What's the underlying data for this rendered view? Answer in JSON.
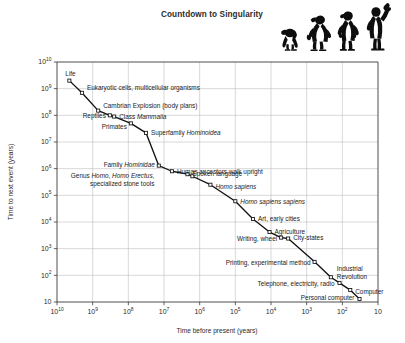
{
  "figure": {
    "title": "Countdown to Singularity",
    "width": 405,
    "height": 343,
    "background": "#ffffff",
    "ink_color": "#111111",
    "grid_color": "#b8b8b8"
  },
  "decoration": {
    "evolution_figures": {
      "name": "march-of-progress-silhouettes",
      "count": 4,
      "description": "ape to upright human holding torch",
      "color": "#0d0d0d"
    }
  },
  "chart_data": {
    "type": "line",
    "title": "Countdown to Singularity",
    "xlabel": "Time before present (years)",
    "ylabel": "Time to next event (years)",
    "xscale": "log",
    "yscale": "log",
    "x_reversed": true,
    "xlim": [
      10000000000,
      10
    ],
    "ylim": [
      10,
      10000000000
    ],
    "grid": true,
    "legend": "none",
    "marker": "open-square",
    "xticks": [
      {
        "value": 10000000000,
        "mantissa": "10",
        "exponent": "10"
      },
      {
        "value": 1000000000,
        "mantissa": "10",
        "exponent": "9"
      },
      {
        "value": 100000000,
        "mantissa": "10",
        "exponent": "8"
      },
      {
        "value": 10000000,
        "mantissa": "10",
        "exponent": "7"
      },
      {
        "value": 1000000,
        "mantissa": "10",
        "exponent": "6"
      },
      {
        "value": 100000,
        "mantissa": "10",
        "exponent": "5"
      },
      {
        "value": 10000,
        "mantissa": "10",
        "exponent": "4"
      },
      {
        "value": 1000,
        "mantissa": "10",
        "exponent": "3"
      },
      {
        "value": 100,
        "mantissa": "10",
        "exponent": "2"
      },
      {
        "value": 10,
        "mantissa": "10",
        "exponent": ""
      }
    ],
    "yticks": [
      {
        "value": 10000000000,
        "mantissa": "10",
        "exponent": "10"
      },
      {
        "value": 1000000000,
        "mantissa": "10",
        "exponent": "9"
      },
      {
        "value": 100000000,
        "mantissa": "10",
        "exponent": "8"
      },
      {
        "value": 10000000,
        "mantissa": "10",
        "exponent": "7"
      },
      {
        "value": 1000000,
        "mantissa": "10",
        "exponent": "6"
      },
      {
        "value": 100000,
        "mantissa": "10",
        "exponent": "5"
      },
      {
        "value": 10000,
        "mantissa": "10",
        "exponent": "4"
      },
      {
        "value": 1000,
        "mantissa": "10",
        "exponent": "3"
      },
      {
        "value": 100,
        "mantissa": "10",
        "exponent": "2"
      },
      {
        "value": 10,
        "mantissa": "10",
        "exponent": ""
      }
    ],
    "points": [
      {
        "label": "Life",
        "x": 4500000000,
        "y": 2000000000,
        "label_dx": -4,
        "label_dy": -5,
        "anchor": "start",
        "lines": [
          [
            {
              "t": "Life"
            }
          ]
        ]
      },
      {
        "label": "Eukaryotic cells, multicellular organisms",
        "x": 2000000000,
        "y": 700000000,
        "label_dx": 5,
        "label_dy": -2.5,
        "anchor": "start",
        "lines": [
          [
            {
              "t": "Eukaryotic cells, multicellular organisms"
            }
          ]
        ]
      },
      {
        "label": "Cambrian Explosion (body plans)",
        "x": 700000000,
        "y": 150000000,
        "label_dx": 5,
        "label_dy": -2.5,
        "anchor": "start",
        "lines": [
          [
            {
              "t": "Cambrian Explosion (body plans)"
            }
          ]
        ]
      },
      {
        "label": "Reptiles",
        "x": 330000000,
        "y": 100000000,
        "label_dx": -4,
        "label_dy": 3,
        "anchor": "end",
        "lines": [
          [
            {
              "t": "Reptiles"
            }
          ]
        ]
      },
      {
        "label": "Class Mammalia",
        "x": 250000000,
        "y": 90000000,
        "label_dx": 5,
        "label_dy": 2.5,
        "anchor": "start",
        "lines": [
          [
            {
              "t": "Class "
            },
            {
              "t": "Mammalia",
              "i": true
            }
          ]
        ]
      },
      {
        "label": "Primates",
        "x": 85000000,
        "y": 50000000,
        "label_dx": -4,
        "label_dy": 6,
        "anchor": "end",
        "lines": [
          [
            {
              "t": "Primates"
            }
          ]
        ]
      },
      {
        "label": "Superfamily Hominoidea",
        "x": 32000000,
        "y": 22000000,
        "label_dx": 5,
        "label_dy": 2.5,
        "anchor": "start",
        "lines": [
          [
            {
              "t": "Superfamily "
            },
            {
              "t": "Hominoidea",
              "i": true
            }
          ]
        ]
      },
      {
        "label": "Family Hominidae",
        "x": 14000000,
        "y": 1300000,
        "label_dx": -4,
        "label_dy": 1,
        "anchor": "end",
        "lines": [
          [
            {
              "t": "Family "
            },
            {
              "t": "Hominidae",
              "i": true
            }
          ]
        ]
      },
      {
        "label": "Human ancestors walk upright",
        "x": 6000000,
        "y": 800000,
        "label_dx": 5,
        "label_dy": 2.5,
        "anchor": "start",
        "lines": [
          [
            {
              "t": "Human ancestors walk upright"
            }
          ]
        ]
      },
      {
        "label": "Spoken language",
        "x": 2200000,
        "y": 620000,
        "label_dx": 5,
        "label_dy": 1.5,
        "anchor": "start",
        "lines": [
          [
            {
              "t": "Spoken language"
            }
          ]
        ]
      },
      {
        "label": "Genus Homo, Homo Erectus, specialized stone tools",
        "x": 1600000,
        "y": 520000,
        "label_dx": -38,
        "label_dy": 2,
        "anchor": "end",
        "lines": [
          [
            {
              "t": "Genus "
            },
            {
              "t": "Homo",
              "i": true
            },
            {
              "t": ", "
            },
            {
              "t": "Homo Erectus",
              "i": true
            },
            {
              "t": ","
            }
          ],
          [
            {
              "t": "specialized stone tools"
            }
          ]
        ]
      },
      {
        "label": "Homo sapiens",
        "x": 500000,
        "y": 250000,
        "label_dx": 5,
        "label_dy": 4,
        "anchor": "start",
        "lines": [
          [
            {
              "t": "Homo sapiens",
              "i": true
            }
          ]
        ]
      },
      {
        "label": "Homo sapiens sapiens",
        "x": 100000,
        "y": 60000,
        "label_dx": 5,
        "label_dy": 2.5,
        "anchor": "start",
        "lines": [
          [
            {
              "t": "Homo sapiens sapiens",
              "i": true
            }
          ]
        ]
      },
      {
        "label": "Art, early cities",
        "x": 32000,
        "y": 13000,
        "label_dx": 5,
        "label_dy": 2,
        "anchor": "start",
        "lines": [
          [
            {
              "t": "Art, early cities"
            }
          ]
        ]
      },
      {
        "label": "Agriculture",
        "x": 11000,
        "y": 4200,
        "label_dx": 5,
        "label_dy": 2,
        "anchor": "start",
        "lines": [
          [
            {
              "t": "Agriculture"
            }
          ]
        ]
      },
      {
        "label": "Writing, wheel",
        "x": 5200,
        "y": 2600,
        "label_dx": -4,
        "label_dy": 3.5,
        "anchor": "end",
        "lines": [
          [
            {
              "t": "Writing, wheel"
            }
          ]
        ]
      },
      {
        "label": "City-states",
        "x": 3300,
        "y": 2400,
        "label_dx": 5,
        "label_dy": 1.5,
        "anchor": "start",
        "lines": [
          [
            {
              "t": "City-states"
            }
          ]
        ]
      },
      {
        "label": "Printing, experimental method",
        "x": 600,
        "y": 320,
        "label_dx": -4,
        "label_dy": 3,
        "anchor": "end",
        "lines": [
          [
            {
              "t": "Printing, experimental method"
            }
          ]
        ]
      },
      {
        "label": "Industrial Revolution",
        "x": 210,
        "y": 85,
        "label_dx": 6,
        "label_dy": -6,
        "anchor": "start",
        "lines": [
          [
            {
              "t": "Industrial"
            }
          ],
          [
            {
              "t": "Revolution"
            }
          ]
        ]
      },
      {
        "label": "Telephone, electricity, radio",
        "x": 120,
        "y": 52,
        "label_dx": -5,
        "label_dy": 3,
        "anchor": "end",
        "lines": [
          [
            {
              "t": "Telephone, electricity, radio"
            }
          ]
        ]
      },
      {
        "label": "Computer",
        "x": 60,
        "y": 28,
        "label_dx": 5,
        "label_dy": 4,
        "anchor": "start",
        "lines": [
          [
            {
              "t": "Computer"
            }
          ]
        ]
      },
      {
        "label": "Personal computer",
        "x": 33,
        "y": 13,
        "label_dx": -5,
        "label_dy": 1.5,
        "anchor": "end",
        "lines": [
          [
            {
              "t": "Personal computer"
            }
          ]
        ]
      }
    ]
  }
}
